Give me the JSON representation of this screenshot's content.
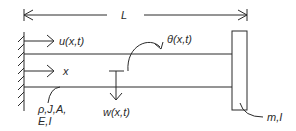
{
  "diagram": {
    "labels": {
      "length": "L",
      "axial_displacement": "u(x,t)",
      "axis": "x",
      "rotation": "θ(x,t)",
      "transverse_displacement": "w(x,t)",
      "beam_props_line1": "ρ,J,A,",
      "beam_props_line2": "E,I",
      "tip_mass": "m,I"
    },
    "colors": {
      "stroke": "#2a2a2a",
      "background": "#ffffff"
    }
  }
}
